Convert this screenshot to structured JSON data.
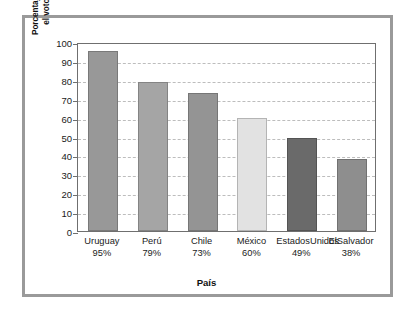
{
  "chart_data": {
    "type": "bar",
    "title": "",
    "xlabel": "País",
    "ylabel_line1": "Porcentaje de votantes que ejercieron",
    "ylabel_line2": "el voto en las últimas elecciones",
    "categories": [
      "Uruguay",
      "Perú",
      "Chile",
      "México",
      "Estados Unidos",
      "El Salvador"
    ],
    "category_lines": [
      [
        "Uruguay"
      ],
      [
        "Perú"
      ],
      [
        "Chile"
      ],
      [
        "México"
      ],
      [
        "Estados",
        "Unidos"
      ],
      [
        "El",
        "Salvador"
      ]
    ],
    "values": [
      95,
      79,
      73,
      60,
      49,
      38
    ],
    "value_labels": [
      "95%",
      "79%",
      "73%",
      "60%",
      "49%",
      "38%"
    ],
    "bar_colors": [
      "#989898",
      "#a5a5a5",
      "#949494",
      "#e2e2e2",
      "#6a6a6a",
      "#8e8e8e"
    ],
    "ylim": [
      0,
      100
    ],
    "ytick_values": [
      0,
      10,
      20,
      30,
      40,
      50,
      60,
      70,
      80,
      90,
      100
    ],
    "ytick_labels": [
      "0",
      "10",
      "20",
      "30",
      "40",
      "50",
      "60",
      "70",
      "80",
      "90",
      "100"
    ],
    "grid": true,
    "grid_color": "#bdbdbd",
    "legend": "none",
    "frame_color": "#9a9a9a",
    "axis_color": "#6f6f6f",
    "background": "#ffffff"
  }
}
